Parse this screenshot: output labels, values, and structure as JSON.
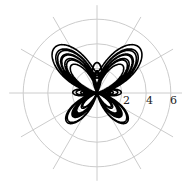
{
  "chart_data": {
    "type": "line",
    "subtype": "polar",
    "title": "",
    "equation": "r = e^sin(θ) − 2cos(4θ) + sin^5((2θ − π)/24)",
    "theta_range": [
      0,
      75.4
    ],
    "radial_ticks": [
      2,
      4,
      6
    ],
    "radial_tick_labels": [
      "2",
      "4",
      "6"
    ],
    "rlim": [
      0,
      6
    ],
    "angular_grid_deg": [
      0,
      30,
      60,
      90,
      120,
      150,
      180,
      210,
      240,
      270,
      300,
      330
    ],
    "grid": true,
    "series": [
      {
        "name": "butterfly curve",
        "color": "#000000"
      }
    ],
    "colors": {
      "grid": "#cccccc",
      "curve": "#000000",
      "text": "#222222"
    }
  }
}
